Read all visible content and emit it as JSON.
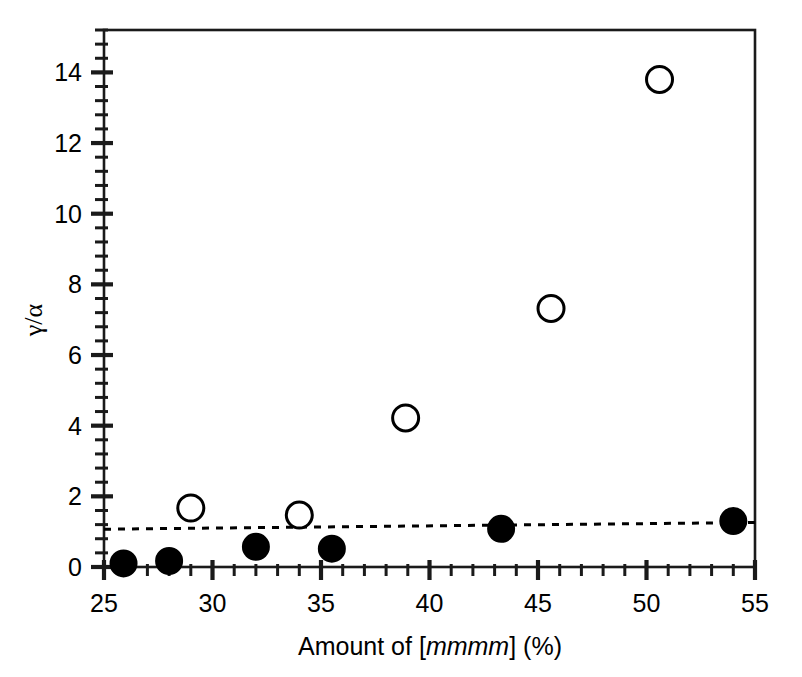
{
  "chart_data": {
    "type": "scatter",
    "title": "",
    "xlabel": "Amount of [mmmm] (%)",
    "xlabel_parts": {
      "prefix": "Amount of [",
      "italic": "mmmm",
      "suffix": "] (%)"
    },
    "ylabel": "γ/α",
    "xlim": [
      25,
      55
    ],
    "ylim": [
      0,
      15.2
    ],
    "x_ticks": [
      25,
      30,
      35,
      40,
      45,
      50,
      55
    ],
    "x_tick_labels": [
      "25",
      "30",
      "35",
      "40",
      "45",
      "50",
      "55"
    ],
    "x_minor_per_major": 5,
    "y_ticks": [
      0,
      2,
      4,
      6,
      8,
      10,
      12,
      14
    ],
    "y_tick_labels": [
      "0",
      "2",
      "4",
      "6",
      "8",
      "10",
      "12",
      "14"
    ],
    "y_minor_per_major": 4,
    "grid": false,
    "legend": "none",
    "series": [
      {
        "name": "open-circles",
        "marker": "open-circle",
        "marker_color": "#000000",
        "fill": "none",
        "points": [
          {
            "x": 29.0,
            "y": 1.67
          },
          {
            "x": 34.0,
            "y": 1.47
          },
          {
            "x": 38.9,
            "y": 4.22
          },
          {
            "x": 45.6,
            "y": 7.32
          },
          {
            "x": 50.6,
            "y": 13.8
          }
        ]
      },
      {
        "name": "filled-circles",
        "marker": "filled-circle",
        "marker_color": "#000000",
        "fill": "#000000",
        "points": [
          {
            "x": 25.9,
            "y": 0.1
          },
          {
            "x": 28.0,
            "y": 0.17
          },
          {
            "x": 32.0,
            "y": 0.57
          },
          {
            "x": 35.5,
            "y": 0.52
          },
          {
            "x": 43.3,
            "y": 1.08
          },
          {
            "x": 54.0,
            "y": 1.3
          }
        ]
      }
    ],
    "annotations": [
      {
        "type": "dashed-line",
        "name": "reference-dashed-line",
        "x0": 25.0,
        "y0": 1.07,
        "x1": 55.0,
        "y1": 1.26,
        "color": "#000000",
        "dash": "7,7"
      }
    ],
    "style": {
      "axis_color": "#000000",
      "background": "#ffffff",
      "frame": "box",
      "tick_direction": "in-out",
      "open_marker_radius_px": 13,
      "filled_marker_radius_px": 13
    }
  }
}
